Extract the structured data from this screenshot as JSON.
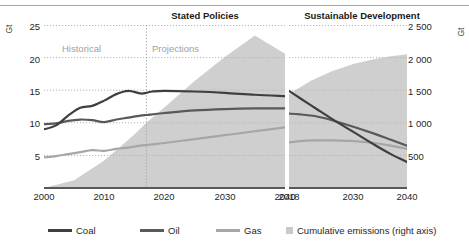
{
  "panels": {
    "left": {
      "title": "Stated Policies"
    },
    "right": {
      "title": "Sustainable Development"
    }
  },
  "axes": {
    "left_unit": "Gt",
    "right_unit": "Gt",
    "left_ticks": [
      "25",
      "20",
      "15",
      "10",
      "5"
    ],
    "right_ticks": [
      "2 500",
      "2 000",
      "1 500",
      "1 000",
      "500"
    ],
    "left_xticks": [
      "2000",
      "2010",
      "2020",
      "2030",
      "2040"
    ],
    "right_xticks": [
      "2018",
      "2030",
      "2040"
    ]
  },
  "annotations": {
    "historical": "Historical",
    "projections": "Projections"
  },
  "legend": {
    "coal": "Coal",
    "oil": "Oil",
    "gas": "Gas",
    "cumulative": "Cumulative emissions (right axis)"
  },
  "colors": {
    "coal": "#3f3f3f",
    "oil": "#595959",
    "gas": "#a6a6a6",
    "area": "#cfcfcf",
    "gridline": "#c0c0c0",
    "divider": "#b0b0b0",
    "annotation_text": "#a0a0a0",
    "title_text": "#1a1a1a"
  },
  "chart_data": {
    "type": "line",
    "xlabel": "",
    "ylabel": "Gt",
    "ylim": [
      0,
      25
    ],
    "y2label": "Gt",
    "y2lim": [
      0,
      2500
    ],
    "grid": "horizontal dotted",
    "legend_position": "bottom",
    "panels": [
      {
        "name": "Stated Policies",
        "xlim": [
          2000,
          2040
        ],
        "xticks": [
          2000,
          2010,
          2020,
          2030,
          2040
        ],
        "divider_year": 2017,
        "divider_labels": [
          "Historical",
          "Projections"
        ],
        "x": [
          2000,
          2002,
          2004,
          2006,
          2008,
          2010,
          2012,
          2014,
          2016,
          2017,
          2018,
          2020,
          2025,
          2030,
          2035,
          2040
        ],
        "series": [
          {
            "name": "Coal",
            "values": [
              9.0,
              9.6,
              11.1,
              12.3,
              12.6,
              13.4,
              14.4,
              14.9,
              14.5,
              14.6,
              14.8,
              14.9,
              14.8,
              14.6,
              14.3,
              14.1
            ]
          },
          {
            "name": "Oil",
            "values": [
              9.8,
              9.9,
              10.3,
              10.5,
              10.4,
              10.1,
              10.5,
              10.8,
              11.1,
              11.2,
              11.3,
              11.5,
              11.9,
              12.1,
              12.2,
              12.2
            ]
          },
          {
            "name": "Gas",
            "values": [
              4.7,
              4.9,
              5.2,
              5.5,
              5.8,
              5.7,
              6.0,
              6.2,
              6.5,
              6.6,
              6.7,
              6.9,
              7.5,
              8.1,
              8.7,
              9.3
            ]
          }
        ],
        "area": {
          "name": "Cumulative emissions (right axis)",
          "x": [
            2000,
            2005,
            2010,
            2015,
            2017,
            2020,
            2025,
            2030,
            2035,
            2040
          ],
          "values": [
            0,
            120,
            420,
            820,
            1000,
            1240,
            1640,
            2010,
            2340,
            2060
          ]
        }
      },
      {
        "name": "Sustainable Development",
        "xlim": [
          2018,
          2040
        ],
        "xticks": [
          2018,
          2030,
          2040
        ],
        "x": [
          2018,
          2020,
          2023,
          2026,
          2030,
          2034,
          2037,
          2040
        ],
        "series": [
          {
            "name": "Coal",
            "values": [
              14.9,
              13.8,
              12.2,
              10.6,
              8.6,
              6.6,
              5.2,
              4.0
            ]
          },
          {
            "name": "Oil",
            "values": [
              11.4,
              11.3,
              11.0,
              10.4,
              9.4,
              8.3,
              7.4,
              6.5
            ]
          },
          {
            "name": "Gas",
            "values": [
              7.0,
              7.2,
              7.3,
              7.3,
              7.2,
              6.9,
              6.5,
              6.0
            ]
          }
        ],
        "area": {
          "name": "Cumulative emissions (right axis)",
          "x": [
            2018,
            2022,
            2026,
            2030,
            2034,
            2037,
            2040
          ],
          "values": [
            1440,
            1640,
            1790,
            1900,
            1980,
            2020,
            2050
          ]
        }
      }
    ]
  }
}
